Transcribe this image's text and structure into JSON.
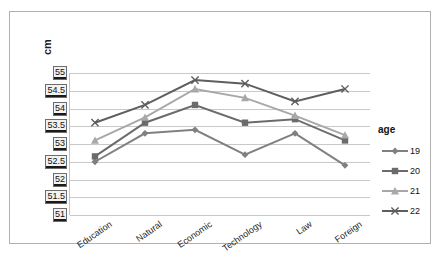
{
  "chart_data": {
    "type": "line",
    "title": "",
    "xlabel": "",
    "ylabel": "cm",
    "ylim": [
      51,
      55
    ],
    "ytick_step": 0.5,
    "yticks": [
      "55",
      "54.5",
      "54",
      "53.5",
      "53",
      "52.5",
      "52",
      "51.5",
      "51"
    ],
    "grid": true,
    "categories": [
      "Education",
      "Natural",
      "Economic",
      "Technology",
      "Law",
      "Foreign"
    ],
    "legend_title": "age",
    "legend_position": "right",
    "series": [
      {
        "name": "19",
        "marker": "diamond",
        "color": "#808080",
        "values": [
          52.5,
          53.3,
          53.4,
          52.7,
          53.3,
          52.4
        ]
      },
      {
        "name": "20",
        "marker": "square",
        "color": "#6b6b6b",
        "values": [
          52.65,
          53.6,
          54.1,
          53.6,
          53.7,
          53.1
        ]
      },
      {
        "name": "21",
        "marker": "triangle",
        "color": "#a8a8a8",
        "values": [
          53.1,
          53.75,
          54.55,
          54.3,
          53.8,
          53.25
        ]
      },
      {
        "name": "22",
        "marker": "cross",
        "color": "#5e5e5e",
        "values": [
          53.6,
          54.1,
          54.8,
          54.7,
          54.2,
          54.55
        ]
      }
    ]
  },
  "colors": {
    "frame_border": "#b0b0b0",
    "gridline": "#c9c9c9",
    "tick_label_bg": "#f2f2f2",
    "background": "#ffffff"
  }
}
